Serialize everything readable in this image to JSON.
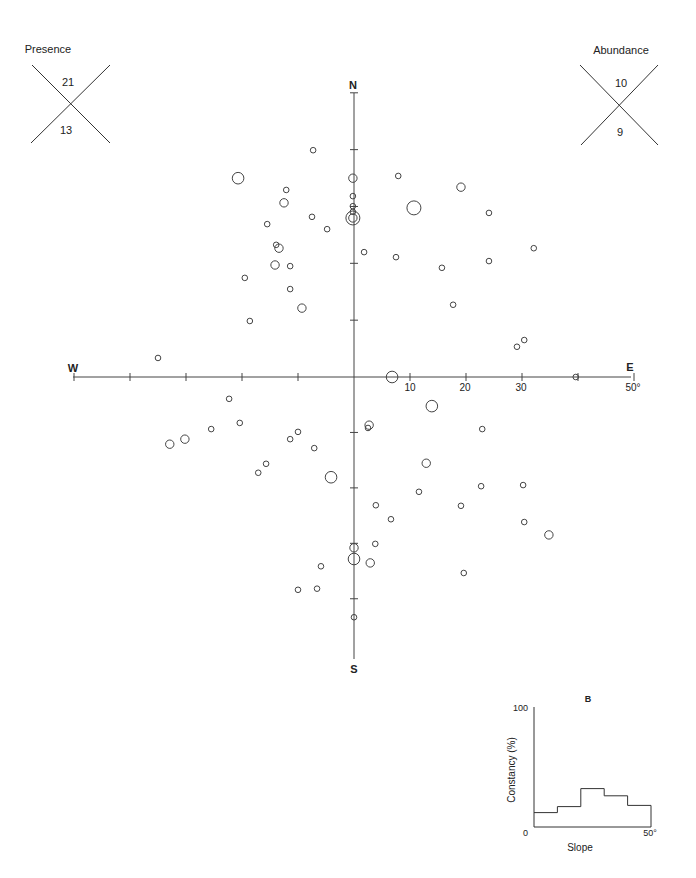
{
  "legend_presence": {
    "title": "Presence",
    "top": "21",
    "bottom": "13"
  },
  "legend_abundance": {
    "title": "Abundance",
    "top": "10",
    "bottom": "9"
  },
  "compass": {
    "n": "N",
    "s": "S",
    "e": "E",
    "w": "W"
  },
  "chart_data": [
    {
      "type": "scatter",
      "title": "Aspect / slope polar plot",
      "xlabel": "W – E (slope, degrees)",
      "ylabel": "S – N (slope, degrees)",
      "xlim": [
        -50,
        50
      ],
      "ylim": [
        -50,
        50
      ],
      "x_tick_labels": [
        "10",
        "20",
        "30",
        "50°"
      ],
      "x_ticks": [
        -50,
        -40,
        -30,
        -20,
        -10,
        10,
        20,
        30,
        40,
        50
      ],
      "y_ticks": [
        -40,
        -30,
        -20,
        -10,
        10,
        20,
        30,
        40,
        50
      ],
      "grid": false,
      "points_note": "x = east(+)/west(-) slope degrees, y = north(+)/south(-) slope degrees, size = circle size class (1 small … 4 large)",
      "points": [
        {
          "x": -7.3,
          "y": 40.5,
          "size": 1
        },
        {
          "x": -20.7,
          "y": 35.5,
          "size": 3
        },
        {
          "x": -12.1,
          "y": 33.4,
          "size": 1
        },
        {
          "x": -12.5,
          "y": 31.1,
          "size": 2
        },
        {
          "x": -15.5,
          "y": 27.3,
          "size": 1
        },
        {
          "x": -7.5,
          "y": 28.6,
          "size": 1
        },
        {
          "x": -4.8,
          "y": 26.4,
          "size": 1
        },
        {
          "x": -13.9,
          "y": 23.6,
          "size": 1
        },
        {
          "x": -13.4,
          "y": 23.0,
          "size": 2
        },
        {
          "x": -14.1,
          "y": 20.0,
          "size": 2
        },
        {
          "x": -11.4,
          "y": 19.8,
          "size": 1
        },
        {
          "x": -19.5,
          "y": 17.7,
          "size": 1
        },
        {
          "x": -11.4,
          "y": 15.7,
          "size": 1
        },
        {
          "x": -9.3,
          "y": 12.3,
          "size": 2
        },
        {
          "x": -18.6,
          "y": 10.0,
          "size": 1
        },
        {
          "x": -35.0,
          "y": 3.4,
          "size": 1
        },
        {
          "x": -0.2,
          "y": 35.5,
          "size": 2
        },
        {
          "x": -0.2,
          "y": 32.3,
          "size": 1
        },
        {
          "x": -0.2,
          "y": 30.5,
          "size": 1
        },
        {
          "x": -0.2,
          "y": 29.5,
          "size": 1
        },
        {
          "x": -0.2,
          "y": 28.4,
          "size": 2
        },
        {
          "x": -0.2,
          "y": 28.4,
          "size": 4
        },
        {
          "x": 7.9,
          "y": 35.9,
          "size": 1
        },
        {
          "x": 19.1,
          "y": 33.9,
          "size": 2
        },
        {
          "x": 10.7,
          "y": 30.2,
          "size": 4
        },
        {
          "x": 24.1,
          "y": 29.3,
          "size": 1
        },
        {
          "x": 1.8,
          "y": 22.3,
          "size": 1
        },
        {
          "x": 7.5,
          "y": 21.4,
          "size": 1
        },
        {
          "x": 15.7,
          "y": 19.5,
          "size": 1
        },
        {
          "x": 24.1,
          "y": 20.7,
          "size": 1
        },
        {
          "x": 32.1,
          "y": 23.0,
          "size": 1
        },
        {
          "x": 17.7,
          "y": 12.9,
          "size": 1
        },
        {
          "x": 29.1,
          "y": 5.4,
          "size": 1
        },
        {
          "x": 30.4,
          "y": 6.6,
          "size": 1
        },
        {
          "x": 6.8,
          "y": 0.0,
          "size": 3
        },
        {
          "x": 39.6,
          "y": 0.0,
          "size": 1
        },
        {
          "x": 13.9,
          "y": -5.2,
          "size": 3
        },
        {
          "x": 2.7,
          "y": -8.6,
          "size": 2
        },
        {
          "x": 2.5,
          "y": -9.1,
          "size": 1
        },
        {
          "x": 22.9,
          "y": -9.3,
          "size": 1
        },
        {
          "x": 12.9,
          "y": -15.4,
          "size": 2
        },
        {
          "x": 22.7,
          "y": -19.5,
          "size": 1
        },
        {
          "x": 30.2,
          "y": -19.3,
          "size": 1
        },
        {
          "x": 11.6,
          "y": -20.5,
          "size": 1
        },
        {
          "x": 3.9,
          "y": -22.9,
          "size": 1
        },
        {
          "x": 19.1,
          "y": -23.0,
          "size": 1
        },
        {
          "x": 6.6,
          "y": -25.4,
          "size": 1
        },
        {
          "x": 30.4,
          "y": -25.9,
          "size": 1
        },
        {
          "x": 34.8,
          "y": -28.2,
          "size": 2
        },
        {
          "x": 3.8,
          "y": -29.8,
          "size": 1
        },
        {
          "x": 2.9,
          "y": -33.2,
          "size": 2
        },
        {
          "x": 19.6,
          "y": -35.0,
          "size": 1
        },
        {
          "x": -22.3,
          "y": -3.9,
          "size": 1
        },
        {
          "x": -20.4,
          "y": -8.2,
          "size": 1
        },
        {
          "x": -25.5,
          "y": -9.3,
          "size": 1
        },
        {
          "x": -30.2,
          "y": -11.1,
          "size": 2
        },
        {
          "x": -32.9,
          "y": -12.0,
          "size": 2
        },
        {
          "x": -10.0,
          "y": -9.8,
          "size": 1
        },
        {
          "x": -11.4,
          "y": -11.1,
          "size": 1
        },
        {
          "x": -7.1,
          "y": -12.7,
          "size": 1
        },
        {
          "x": -15.7,
          "y": -15.5,
          "size": 1
        },
        {
          "x": -17.1,
          "y": -17.1,
          "size": 1
        },
        {
          "x": -4.1,
          "y": -17.9,
          "size": 3
        },
        {
          "x": 0.0,
          "y": -30.5,
          "size": 2
        },
        {
          "x": 0.0,
          "y": -32.5,
          "size": 3
        },
        {
          "x": -5.9,
          "y": -33.8,
          "size": 1
        },
        {
          "x": -10.0,
          "y": -38.0,
          "size": 1
        },
        {
          "x": -6.6,
          "y": -37.8,
          "size": 1
        },
        {
          "x": 0.0,
          "y": -42.9,
          "size": 1
        }
      ]
    },
    {
      "type": "bar",
      "title": "B",
      "xlabel": "Slope",
      "ylabel": "Constancy (%)",
      "categories": [
        "0-10",
        "10-20",
        "20-30",
        "30-40",
        "40-50"
      ],
      "values": [
        12,
        17,
        32,
        26,
        18
      ],
      "ylim": [
        0,
        100
      ],
      "xlim": [
        0,
        50
      ],
      "x_tick_labels": [
        "0",
        "50°"
      ],
      "y_tick_labels": [
        "0",
        "100"
      ],
      "style": "step-histogram"
    }
  ],
  "histogram_labels": {
    "title": "B",
    "xlabel": "Slope",
    "ylabel": "Constancy (%)",
    "x0": "0",
    "x50": "50°",
    "y0": "0",
    "y100": "100"
  },
  "axis_labels": {
    "t10": "10",
    "t20": "20",
    "t30": "30",
    "t50": "50°"
  }
}
